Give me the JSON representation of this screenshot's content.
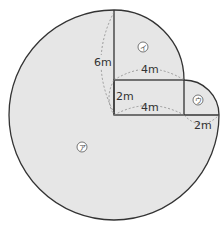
{
  "diagram": {
    "colors": {
      "fill": "#e6e6e6",
      "outline": "#333333",
      "dashed": "#888888",
      "text": "#333333"
    },
    "regions": {
      "a": {
        "mark": "ア"
      },
      "i": {
        "mark": "イ"
      },
      "u": {
        "mark": "ウ"
      }
    },
    "lengths": {
      "vertical_6m": "6m",
      "arc_i_4m": "4m",
      "rect_height_2m": "2m",
      "rect_width_4m": "4m",
      "right_2m": "2m"
    }
  }
}
